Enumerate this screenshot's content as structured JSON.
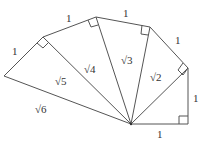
{
  "diagram": {
    "stroke_color": "#555555",
    "labels": {
      "bottom_leg": "1",
      "right_leg": "1",
      "leg3": "1",
      "leg4": "1",
      "leg5": "1",
      "leg6": "1",
      "hyp_sqrt2": "√2",
      "hyp_sqrt3": "√3",
      "hyp_sqrt4": "√4",
      "hyp_sqrt5": "√5",
      "hyp_sqrt6": "√6"
    }
  }
}
